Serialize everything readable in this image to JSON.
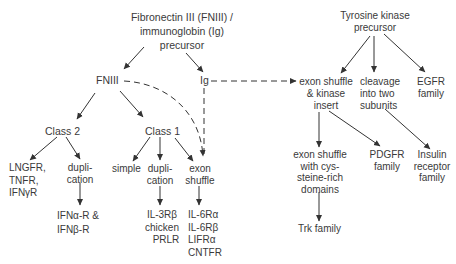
{
  "diagram": {
    "nodes": {
      "fn_ig_precursor": [
        "Fibronectin  III (FNIII) /",
        "immunoglobin  (Ig)",
        "precursor"
      ],
      "fniii": "FNIII",
      "ig": "Ig",
      "class2": "Class  2",
      "class1": "Class 1",
      "lngfr": [
        "LNGFR,",
        "TNFR,",
        "IFNγR"
      ],
      "dup_c2": [
        "dupli-",
        "cation"
      ],
      "ifn": [
        "IFNα-R  &",
        "IFNβ-R"
      ],
      "simple": "simple",
      "dup_c1": [
        "dupli-",
        "cation"
      ],
      "il3": [
        "IL-3Rβ",
        "chicken",
        "PRLR"
      ],
      "exon_c1": [
        "exon",
        "shuffle"
      ],
      "il6": [
        "IL-6Rα",
        "IL-6Rβ",
        "LIFRα",
        "CNTFR"
      ],
      "tk_precursor": [
        "Tyrosine kinase",
        "precursor"
      ],
      "exon_kinase": [
        "exon shuffle",
        "& kinase",
        "insert"
      ],
      "cleavage": [
        "cleavage",
        "into two",
        "subunits"
      ],
      "egfr": [
        "EGFR",
        "family"
      ],
      "exon_cys": [
        "exon shuffle",
        "with cys-",
        "steine-rich",
        "domains"
      ],
      "pdgfr": [
        "PDGFR",
        "family"
      ],
      "insulin": [
        "Insulin",
        "receptor",
        "family"
      ],
      "trk": "Trk family"
    },
    "colors": {
      "line": "#333333",
      "text": "#3a3a3a",
      "background": "#ffffff"
    }
  }
}
